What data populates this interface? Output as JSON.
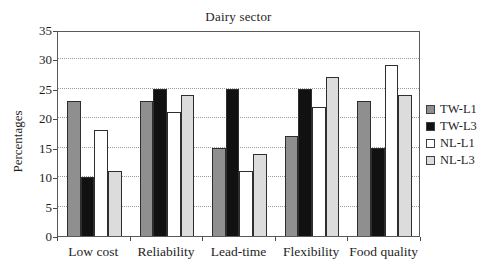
{
  "title": "Dairy sector",
  "ylabel": "Percentages",
  "colors": {
    "frame": "#5a5a5a",
    "gridline": "#9c9c9c",
    "bar_outline": "#2e2e2e",
    "text": "#1e1e1e"
  },
  "chart_data": {
    "type": "bar",
    "title": "Dairy sector",
    "xlabel": "",
    "ylabel": "Percentages",
    "ylim": [
      0,
      35
    ],
    "ytick_step": 5,
    "yticks": [
      0,
      5,
      10,
      15,
      20,
      25,
      30,
      35
    ],
    "grid": "dotted horizontal",
    "legend_position": "right",
    "categories": [
      "Low cost",
      "Reliability",
      "Lead-time",
      "Flexibility",
      "Food quality"
    ],
    "series": [
      {
        "name": "TW-L1",
        "color": "#8f8f8f",
        "values": [
          23,
          23,
          15,
          17,
          23
        ]
      },
      {
        "name": "TW-L3",
        "color": "#111111",
        "values": [
          10,
          25,
          25,
          25,
          15
        ]
      },
      {
        "name": "NL-L1",
        "color": "#ffffff",
        "values": [
          18,
          21,
          11,
          22,
          29
        ]
      },
      {
        "name": "NL-L3",
        "color": "#dcdcdc",
        "values": [
          11,
          24,
          14,
          27,
          24
        ]
      }
    ]
  }
}
